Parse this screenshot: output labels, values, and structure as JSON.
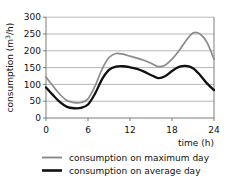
{
  "chart_data": {
    "type": "line",
    "title": "",
    "xlabel": "time (h)",
    "ylabel": "consumption (m3/h)",
    "ylabel_main": "consumption (m",
    "ylabel_sup": "3",
    "ylabel_tail": "/h)",
    "xlim": [
      0,
      24
    ],
    "ylim": [
      0,
      300
    ],
    "grid": true,
    "legend_position": "below",
    "xticks": [
      0,
      6,
      12,
      18,
      24
    ],
    "xtick_labels": [
      "0",
      "6",
      "12",
      "18",
      "24"
    ],
    "yticks": [
      0,
      50,
      100,
      150,
      200,
      250,
      300
    ],
    "ytick_labels": [
      "0",
      "50",
      "100",
      "150",
      "200",
      "250",
      "300"
    ],
    "x": [
      0,
      1,
      2,
      3,
      4,
      5,
      6,
      7,
      8,
      9,
      10,
      11,
      12,
      13,
      14,
      15,
      16,
      17,
      18,
      19,
      20,
      21,
      22,
      23,
      24
    ],
    "series": [
      {
        "name": "consumption on maximum day",
        "color": "#8a8a8a",
        "values": [
          122,
          95,
          70,
          52,
          46,
          46,
          57,
          95,
          145,
          180,
          192,
          190,
          184,
          178,
          172,
          163,
          153,
          157,
          175,
          200,
          230,
          253,
          250,
          225,
          175
        ]
      },
      {
        "name": "consumption on average day",
        "color": "#111111",
        "values": [
          91,
          68,
          47,
          33,
          29,
          30,
          40,
          72,
          115,
          143,
          153,
          154,
          151,
          146,
          138,
          128,
          119,
          124,
          140,
          152,
          155,
          148,
          128,
          103,
          83
        ]
      }
    ]
  },
  "legend": {
    "items": [
      {
        "label": "consumption on maximum day",
        "color": "#8a8a8a"
      },
      {
        "label": "consumption on average day",
        "color": "#111111"
      }
    ]
  }
}
